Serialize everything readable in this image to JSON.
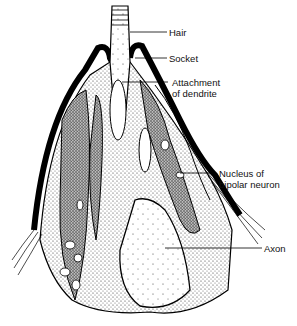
{
  "figure": {
    "labels": [
      {
        "id": "hair",
        "text": "Hair"
      },
      {
        "id": "socket",
        "text": "Socket"
      },
      {
        "id": "attachment1",
        "text": "Attachment"
      },
      {
        "id": "attachment2",
        "text": "of dendrite"
      },
      {
        "id": "nucleus1",
        "text": "Nucleus of"
      },
      {
        "id": "nucleus2",
        "text": "bipolar neuron"
      },
      {
        "id": "axon",
        "text": "Axon"
      }
    ]
  }
}
